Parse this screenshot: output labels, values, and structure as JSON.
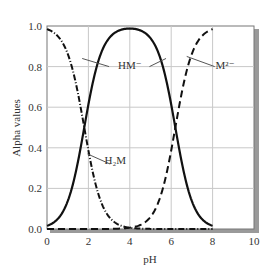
{
  "chart_data": {
    "type": "line",
    "title": "",
    "xlabel": "pH",
    "ylabel": "Alpha values",
    "xlim": [
      0,
      10
    ],
    "ylim": [
      0.0,
      1.0
    ],
    "x_ticks": [
      "0",
      "2",
      "4",
      "6",
      "8",
      "10"
    ],
    "y_ticks": [
      "0.0",
      "0.2",
      "0.4",
      "0.6",
      "0.8",
      "1.0"
    ],
    "grid": true,
    "legend": "inline annotations",
    "pKa": [
      1.8,
      6.2
    ],
    "x": [
      0,
      0.5,
      1,
      1.5,
      1.8,
      2,
      2.5,
      3,
      3.5,
      4,
      4.5,
      5,
      5.5,
      6,
      6.2,
      6.5,
      7,
      7.5,
      8
    ],
    "series": [
      {
        "name": "H2M",
        "label": "H₂M",
        "style": "dash-dot",
        "values": [
          0.98,
          0.95,
          0.86,
          0.67,
          0.5,
          0.39,
          0.17,
          0.06,
          0.02,
          0.006,
          0.002,
          0.001,
          0.0,
          0.0,
          0.0,
          0.0,
          0.0,
          0.0,
          0.0
        ]
      },
      {
        "name": "HM-",
        "label": "HM⁻",
        "style": "solid",
        "values": [
          0.02,
          0.05,
          0.14,
          0.33,
          0.5,
          0.61,
          0.83,
          0.94,
          0.97,
          0.98,
          0.97,
          0.94,
          0.83,
          0.61,
          0.5,
          0.33,
          0.14,
          0.05,
          0.02
        ]
      },
      {
        "name": "M2-",
        "label": "M²⁻",
        "style": "dashed",
        "values": [
          0.0,
          0.0,
          0.0,
          0.0,
          0.0,
          0.0,
          0.0,
          0.001,
          0.002,
          0.006,
          0.02,
          0.06,
          0.17,
          0.39,
          0.5,
          0.67,
          0.86,
          0.95,
          0.98
        ]
      }
    ],
    "annotations": [
      {
        "text": "HM⁻",
        "x": 4.0,
        "y": 0.81
      },
      {
        "text": "M²⁻",
        "x": 8.6,
        "y": 0.81
      },
      {
        "text": "H₂M",
        "x": 3.3,
        "y": 0.34
      }
    ]
  }
}
